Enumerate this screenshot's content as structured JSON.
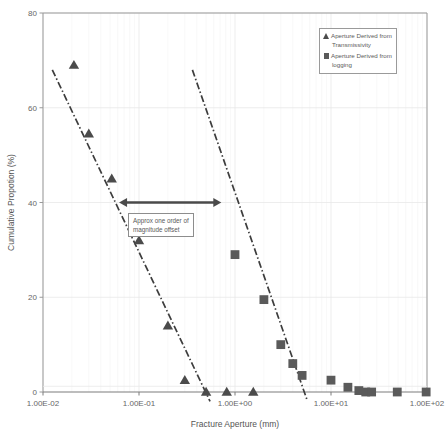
{
  "chart_data": {
    "type": "scatter",
    "title": "",
    "xlabel": "Fracture Aperture (mm)",
    "ylabel": "Cumulative Propotion (%)",
    "xscale": "log",
    "xlim": [
      0.01,
      100
    ],
    "ylim": [
      0,
      80
    ],
    "xticks": [
      0.01,
      0.1,
      1,
      10,
      100
    ],
    "xticklabels": [
      "1.00E-02",
      "1.00E-01",
      "1.00E+00",
      "1.00E+01",
      "1.00E+02"
    ],
    "yticks": [
      0,
      20,
      40,
      60,
      80
    ],
    "yticklabels": [
      "0",
      "20",
      "40",
      "60",
      "80"
    ],
    "grid": true,
    "legend_position": "top-right",
    "series": [
      {
        "name": "Aperture Derived from Transmissivity",
        "marker": "triangle",
        "color": "#4b4b4b",
        "points": [
          {
            "x": 0.021,
            "y": 69.0
          },
          {
            "x": 0.03,
            "y": 54.5
          },
          {
            "x": 0.052,
            "y": 45.0
          },
          {
            "x": 0.1,
            "y": 32.0
          },
          {
            "x": 0.2,
            "y": 14.0
          },
          {
            "x": 0.3,
            "y": 2.5
          },
          {
            "x": 0.5,
            "y": 0.0
          },
          {
            "x": 0.82,
            "y": 0.0
          },
          {
            "x": 1.55,
            "y": 0.0
          }
        ],
        "trendline": {
          "style": "dash-dot",
          "color": "#3d3d3d",
          "x_start": 0.0125,
          "y_start": 68.0,
          "x_end": 0.55,
          "y_end": -2.0
        }
      },
      {
        "name": "Aperture Derived from logging",
        "marker": "square",
        "color": "#5a5a5a",
        "points": [
          {
            "x": 1.0,
            "y": 29.0
          },
          {
            "x": 2.0,
            "y": 19.5
          },
          {
            "x": 3.0,
            "y": 10.0
          },
          {
            "x": 4.0,
            "y": 6.0
          },
          {
            "x": 5.0,
            "y": 3.5
          },
          {
            "x": 10.0,
            "y": 2.5
          },
          {
            "x": 15.0,
            "y": 1.0
          },
          {
            "x": 19.5,
            "y": 0.3
          },
          {
            "x": 23.0,
            "y": 0.0
          },
          {
            "x": 26.5,
            "y": 0.0
          },
          {
            "x": 49.0,
            "y": 0.0
          },
          {
            "x": 98.0,
            "y": 0.0
          }
        ],
        "trendline": {
          "style": "dash-dot",
          "color": "#3d3d3d",
          "x_start": 0.36,
          "y_start": 68.0,
          "x_end": 5.7,
          "y_end": -2.0
        }
      }
    ],
    "annotations": [
      {
        "type": "double-arrow",
        "text_box": "Approx one order of\nmagnitude offset",
        "line1": "Approx one order of",
        "line2": "magnitude offset",
        "x_start": 0.062,
        "x_end": 0.72,
        "y": 40.0
      }
    ]
  },
  "legend": {
    "entries": [
      {
        "marker": "triangle",
        "line1": "Aperture Derived from",
        "line2": "Transmissivity"
      },
      {
        "marker": "square",
        "line1": "Aperture Derived from",
        "line2": "logging"
      }
    ]
  },
  "axis": {
    "x_title": "Fracture Aperture (mm)",
    "y_title": "Cumulative Propotion (%)"
  },
  "colors": {
    "frame": "#9a9a9a",
    "grid_major": "#e8e8e8",
    "grid_minor": "#f3f3f3",
    "marker_tri": "#4b4b4b",
    "marker_sq": "#5a5a5a",
    "trend": "#3d3d3d",
    "arrow": "#4a4a4a",
    "text": "#5a5a5a"
  }
}
